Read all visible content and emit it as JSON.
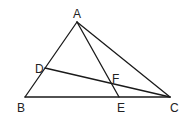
{
  "diagram": {
    "type": "geometry",
    "title": "",
    "points": {
      "A": {
        "label": "A"
      },
      "B": {
        "label": "B"
      },
      "C": {
        "label": "C"
      },
      "D": {
        "label": "D"
      },
      "E": {
        "label": "E"
      },
      "F": {
        "label": "F"
      }
    },
    "segments": [
      {
        "from": "A",
        "to": "B",
        "name": "segment-ab"
      },
      {
        "from": "B",
        "to": "C",
        "name": "segment-bc"
      },
      {
        "from": "A",
        "to": "C",
        "name": "segment-ac"
      },
      {
        "from": "A",
        "to": "E",
        "name": "segment-ae"
      },
      {
        "from": "D",
        "to": "C",
        "name": "segment-dc"
      }
    ],
    "relations": [
      "D lies on AB",
      "E lies on BC",
      "F is the intersection of AE and DC"
    ],
    "colors": {
      "stroke": "#1a1a1a",
      "label": "#222222"
    }
  }
}
